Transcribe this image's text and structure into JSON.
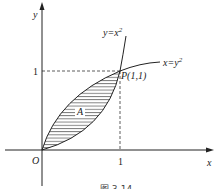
{
  "diagram": {
    "axes": {
      "x_label": "x",
      "y_label": "y",
      "origin_label": "O",
      "x_tick": "1",
      "y_tick": "1"
    },
    "curves": [
      {
        "name": "parabola-y-eq-x2",
        "label": "y=x",
        "exp": "2"
      },
      {
        "name": "parabola-x-eq-y2",
        "label": "x=y",
        "exp": "2"
      }
    ],
    "point": {
      "label": "P(1,1)",
      "x": 1,
      "y": 1
    },
    "region": {
      "label": "A",
      "fill": "horizontal-hatch"
    },
    "caption": "图 3-14"
  }
}
